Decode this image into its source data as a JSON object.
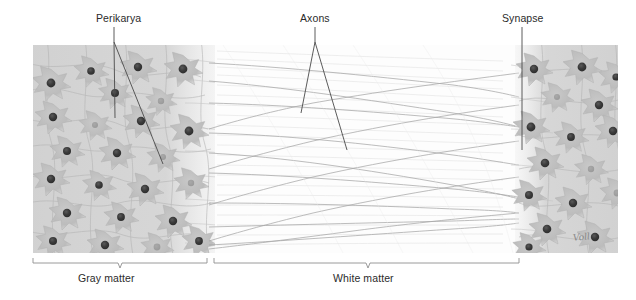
{
  "figure": {
    "title_labels": {
      "perikarya": "Perikarya",
      "axons": "Axons",
      "synapse": "Synapse"
    },
    "region_labels": {
      "gray_matter": "Gray matter",
      "white_matter": "White matter"
    },
    "signature": "Voll",
    "colors": {
      "leader_line": "#4a4a4a",
      "bracket_line": "#8e8e8e",
      "text": "#2b2b2b",
      "gray_matter_tissue": "#d4d4d4",
      "neuron_soma": "#c3c3c3",
      "neuron_nucleus": "#3d3d3d",
      "axon_fiber": "#b9b9b9",
      "background": "#ffffff"
    },
    "regions": [
      {
        "name": "gray-matter",
        "label": "Gray matter",
        "bracket_start": 33,
        "bracket_end": 207,
        "tick": 120
      },
      {
        "name": "white-matter",
        "label": "White matter",
        "bracket_start": 214,
        "bracket_end": 519,
        "tick": 368
      }
    ],
    "callouts": [
      {
        "name": "perikarya",
        "label": "Perikarya",
        "targets": 2
      },
      {
        "name": "axons",
        "label": "Axons",
        "targets": 2
      },
      {
        "name": "synapse",
        "label": "Synapse",
        "targets": 1
      }
    ]
  }
}
